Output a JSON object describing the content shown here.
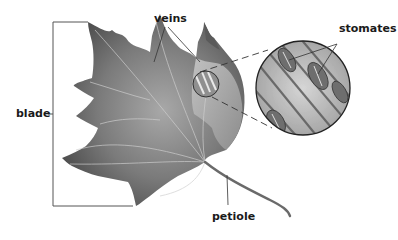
{
  "diagram": {
    "labels": {
      "veins": "veins",
      "stomates": "stomates",
      "blade": "blade",
      "petiole": "petiole"
    },
    "colors": {
      "background": "#ffffff",
      "leaf_dark": "#4a4a4a",
      "leaf_mid": "#7d7d7d",
      "leaf_light": "#b5b5b5",
      "line": "#3a3a3a",
      "text": "#1a1a1a"
    }
  }
}
